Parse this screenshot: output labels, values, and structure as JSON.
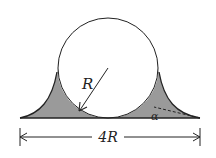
{
  "diagram": {
    "labels": {
      "radius": "R",
      "angle": "α",
      "width": "4R"
    },
    "colors": {
      "fill_shaded": "#9a9a9a",
      "stroke": "#222222",
      "background": "#ffffff"
    }
  }
}
